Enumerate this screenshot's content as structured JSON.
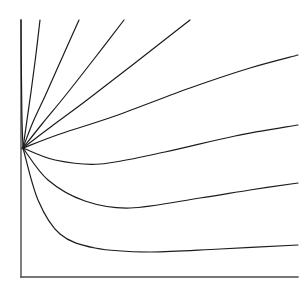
{
  "figure": {
    "type": "phase-portrait",
    "title": "",
    "background_color": "#ffffff",
    "width": 308,
    "height": 289
  },
  "axes": {
    "style": "L-shaped open axes (left spine and bottom spine only)",
    "color": "#4a4a4a",
    "stroke_width": 1.4,
    "x_left": 21,
    "x_right": 298,
    "y_top": 20,
    "y_bottom": 277,
    "ticks": [],
    "tick_labels": [],
    "xlabel": "",
    "ylabel": "",
    "grid": false
  },
  "chart_data": {
    "type": "line",
    "title": "",
    "xlabel": "",
    "ylabel": "",
    "grid": false,
    "legend": "none",
    "xlim": [
      21,
      298
    ],
    "ylim": [
      277,
      20
    ],
    "node": {
      "label": "convergence-node",
      "x": 23,
      "y": 148
    },
    "series": [
      {
        "name": "curve-1",
        "exit_edge": "top",
        "exit_x": 21,
        "exit_y": 20,
        "points": [
          [
            23,
            148
          ],
          [
            22,
            120
          ],
          [
            21.6,
            90
          ],
          [
            21.2,
            55
          ],
          [
            21,
            20
          ]
        ]
      },
      {
        "name": "curve-2",
        "exit_edge": "top",
        "exit_x": 40,
        "exit_y": 20,
        "points": [
          [
            23,
            148
          ],
          [
            27,
            120
          ],
          [
            31,
            92
          ],
          [
            35.5,
            58
          ],
          [
            40,
            20
          ]
        ]
      },
      {
        "name": "curve-3",
        "exit_edge": "top",
        "exit_x": 79,
        "exit_y": 20,
        "points": [
          [
            23,
            148
          ],
          [
            33,
            122
          ],
          [
            46,
            94
          ],
          [
            62,
            58
          ],
          [
            79,
            20
          ]
        ]
      },
      {
        "name": "curve-4",
        "exit_edge": "top",
        "exit_x": 124,
        "exit_y": 20,
        "points": [
          [
            23,
            148
          ],
          [
            42,
            124
          ],
          [
            65,
            96
          ],
          [
            94,
            59
          ],
          [
            124,
            20
          ]
        ]
      },
      {
        "name": "curve-5",
        "exit_edge": "top",
        "exit_x": 190,
        "exit_y": 20,
        "points": [
          [
            23,
            148
          ],
          [
            52,
            126
          ],
          [
            87,
            100
          ],
          [
            135,
            63
          ],
          [
            190,
            20
          ]
        ]
      },
      {
        "name": "curve-6",
        "exit_edge": "right",
        "exit_x": 298,
        "exit_y": 55,
        "points": [
          [
            23,
            148
          ],
          [
            60,
            134
          ],
          [
            115,
            116
          ],
          [
            190,
            88
          ],
          [
            250,
            68
          ],
          [
            298,
            55
          ]
        ]
      },
      {
        "name": "curve-7",
        "exit_edge": "right",
        "exit_x": 298,
        "exit_y": 125,
        "minimum": [
          95,
          163
        ],
        "points": [
          [
            23,
            148
          ],
          [
            55,
            160
          ],
          [
            100,
            164
          ],
          [
            165,
            152
          ],
          [
            235,
            136
          ],
          [
            298,
            125
          ]
        ]
      },
      {
        "name": "curve-8",
        "exit_edge": "right",
        "exit_x": 298,
        "exit_y": 183,
        "minimum": [
          130,
          208
        ],
        "points": [
          [
            23,
            148
          ],
          [
            48,
            180
          ],
          [
            85,
            201
          ],
          [
            130,
            208
          ],
          [
            200,
            198
          ],
          [
            250,
            190
          ],
          [
            298,
            183
          ]
        ]
      },
      {
        "name": "curve-9",
        "exit_edge": "right",
        "exit_x": 298,
        "exit_y": 245,
        "minimum": [
          150,
          252
        ],
        "points": [
          [
            23,
            148
          ],
          [
            38,
            200
          ],
          [
            60,
            234
          ],
          [
            95,
            248
          ],
          [
            150,
            252
          ],
          [
            220,
            249
          ],
          [
            298,
            245
          ]
        ]
      }
    ],
    "curve_color": "#1c1c1c",
    "curve_stroke_width": 1.2,
    "curve_count": 9
  }
}
